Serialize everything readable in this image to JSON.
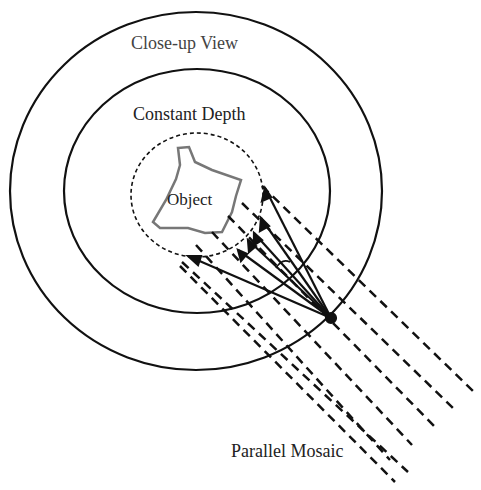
{
  "labels": {
    "outer": "Close-up View",
    "inner": "Constant Depth",
    "object": "Object",
    "mosaic": "Parallel Mosaic"
  },
  "colors": {
    "line": "#111111",
    "object_outline": "#777777",
    "text": "#222222"
  }
}
